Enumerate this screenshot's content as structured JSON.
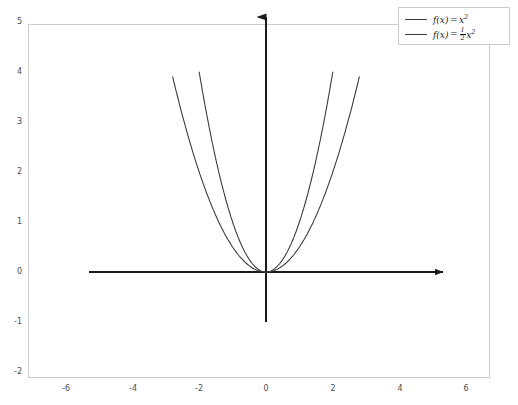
{
  "chart_data": {
    "type": "line",
    "title": "",
    "xlabel": "",
    "ylabel": "",
    "xlim": [
      -7.1,
      7.1
    ],
    "ylim": [
      -2.4,
      5.4
    ],
    "grid": false,
    "legend_position": "top-right",
    "xticks": [
      -6,
      -4,
      -2,
      0,
      2,
      4,
      6
    ],
    "xtick_labels": [
      "-6",
      "-4",
      "-2",
      "0",
      "2",
      "4",
      "6"
    ],
    "yticks": [
      5,
      4,
      3,
      2,
      1,
      0,
      -1,
      -2
    ],
    "ytick_labels": [
      "5",
      "4",
      "3",
      "2",
      "1",
      "0",
      "-1",
      "-2"
    ],
    "axis_style": {
      "x_axis_from": -5.3,
      "x_axis_to": 5.3,
      "y_axis_from": -1.0,
      "y_axis_to": 5.1,
      "arrowheads": [
        "x-positive",
        "y-positive"
      ],
      "color": "#1a1a1a"
    },
    "series": [
      {
        "name": "f(x) = x^2",
        "legend_label_parts": {
          "fname": "f",
          "arg": "(x)",
          "equals": "=",
          "body": "x",
          "exponent": "2",
          "coefficient": ""
        },
        "coefficient": 1,
        "color": "#3c3c3c",
        "linewidth": 1.1,
        "x_domain": [
          -2.0,
          2.0
        ],
        "y_clip_max": 4,
        "x": [
          -2.0,
          -1.75,
          -1.5,
          -1.25,
          -1.0,
          -0.75,
          -0.5,
          -0.25,
          0,
          0.25,
          0.5,
          0.75,
          1.0,
          1.25,
          1.5,
          1.75,
          2.0
        ],
        "y": [
          4.0,
          3.0625,
          2.25,
          1.5625,
          1.0,
          0.5625,
          0.25,
          0.0625,
          0,
          0.0625,
          0.25,
          0.5625,
          1.0,
          1.5625,
          2.25,
          3.0625,
          4.0
        ]
      },
      {
        "name": "f(x) = 1/2 x^2",
        "legend_label_parts": {
          "fname": "f",
          "arg": "(x)",
          "equals": "=",
          "body": "x",
          "exponent": "2",
          "coefficient_num": "1",
          "coefficient_den": "2"
        },
        "coefficient": 0.5,
        "color": "#3c3c3c",
        "linewidth": 1.1,
        "x_domain": [
          -2.83,
          2.83
        ],
        "y_clip_max": 4,
        "x": [
          -2.83,
          -2.5,
          -2.0,
          -1.5,
          -1.0,
          -0.5,
          0,
          0.5,
          1.0,
          1.5,
          2.0,
          2.5,
          2.83
        ],
        "y": [
          4.0,
          3.125,
          2.0,
          1.125,
          0.5,
          0.125,
          0,
          0.125,
          0.5,
          1.125,
          2.0,
          3.125,
          4.0
        ]
      }
    ]
  },
  "legend": {
    "entries": [
      {
        "label": "f(x) = x²"
      },
      {
        "label": "f(x) = ½x²"
      }
    ]
  },
  "frame": {
    "border_color": "#cccccc",
    "background": "#ffffff"
  }
}
